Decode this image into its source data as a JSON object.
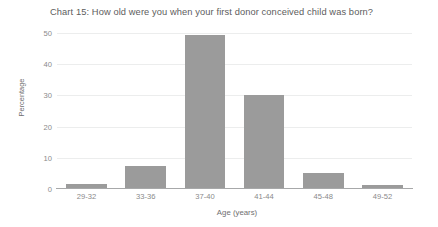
{
  "chart_data": {
    "type": "bar",
    "title": "Chart 15: How old were you when your first donor conceived child was born?",
    "xlabel": "Age (years)",
    "ylabel": "Percentage",
    "categories": [
      "29-32",
      "33-36",
      "37-40",
      "41-44",
      "45-48",
      "49-52"
    ],
    "values": [
      1.5,
      7.5,
      49.5,
      30,
      5,
      1.3
    ],
    "yticks": [
      0,
      10,
      20,
      30,
      40,
      50
    ],
    "ylim": [
      0,
      50
    ],
    "grid": true,
    "legend": "none",
    "bar_color": "#9b9b9b",
    "gridline_color": "#eceded",
    "axis_color": "#a7a8a9",
    "text_color": "#8a8a8a",
    "title_color": "#5d5d5d"
  }
}
